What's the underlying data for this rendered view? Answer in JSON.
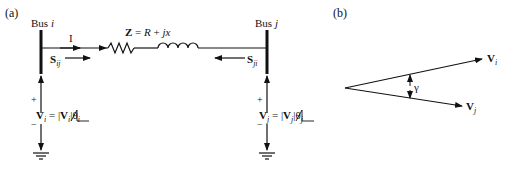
{
  "panel_a": {
    "label": "(a)",
    "bus_i": {
      "label_prefix": "Bus ",
      "label_var": "i"
    },
    "bus_j": {
      "label_prefix": "Bus ",
      "label_var": "j"
    },
    "current": "I",
    "impedance": {
      "bold": "Z",
      "eq": " = ",
      "r": "R",
      "plus": " + ",
      "jx": "jx"
    },
    "s_ij": {
      "base": "S",
      "sub": "ij"
    },
    "s_ji": {
      "base": "S",
      "sub": "ji"
    },
    "v_i": {
      "base": "V",
      "sub": "i",
      "eq": " = |",
      "base2": "V",
      "sub2": "i",
      "abs_end": "|",
      "angle": "θ",
      "angle_sub": "i"
    },
    "v_j": {
      "base": "V",
      "sub": "j",
      "eq": " = |",
      "base2": "V",
      "sub2": "j",
      "abs_end": "|",
      "angle": "θ",
      "angle_sub": "j"
    },
    "plus": "+",
    "minus": "−"
  },
  "panel_b": {
    "label": "(b)",
    "v_i": {
      "base": "V",
      "sub": "i"
    },
    "v_j": {
      "base": "V",
      "sub": "j"
    },
    "gamma": "γ"
  }
}
